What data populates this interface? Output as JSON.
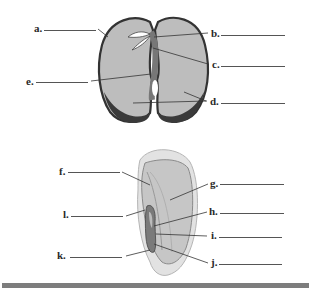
{
  "diagram": {
    "bean_seed": {
      "labels": [
        "a.",
        "b.",
        "c.",
        "d.",
        "e."
      ],
      "colors": {
        "cotyledon": "#bdbdbd",
        "seed_coat": "#3a3a3a",
        "embryo": "#8c8c8c"
      }
    },
    "corn_kernel": {
      "labels": [
        "f.",
        "g.",
        "h.",
        "i.",
        "j.",
        "k.",
        "l."
      ],
      "colors": {
        "pericarp": "#e2e2e2",
        "endosperm": "#c6c6c6",
        "embryo": "#7a7a7a"
      }
    },
    "footer_bar_color": "#7d7d7d"
  }
}
